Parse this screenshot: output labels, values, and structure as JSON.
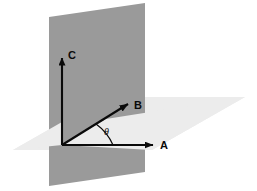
{
  "figure": {
    "background_color": "#ffffff",
    "planes": [
      {
        "name": "vertical-plane",
        "color": "#9a9a9a",
        "orientation": "vertical",
        "description": "Shaded vertical plane containing vectors A and C"
      },
      {
        "name": "horizontal-plane",
        "color": "#ececec",
        "orientation": "horizontal",
        "description": "Light shaded horizontal plane containing vectors A and B"
      }
    ],
    "vectors": [
      {
        "label": "C",
        "direction": "up",
        "color": "#0a0a0a",
        "label_x": 68,
        "label_y": 59
      },
      {
        "label": "B",
        "direction": "up-right-diagonal",
        "color": "#0a0a0a",
        "label_x": 134,
        "label_y": 109
      },
      {
        "label": "A",
        "direction": "right",
        "color": "#0a0a0a",
        "label_x": 160,
        "label_y": 149
      }
    ],
    "angle": {
      "label": "θ",
      "between": [
        "A",
        "B"
      ],
      "label_x": 104,
      "label_y": 135,
      "color": "#0a0a0a"
    },
    "origin": {
      "x": 62,
      "y": 145
    }
  }
}
